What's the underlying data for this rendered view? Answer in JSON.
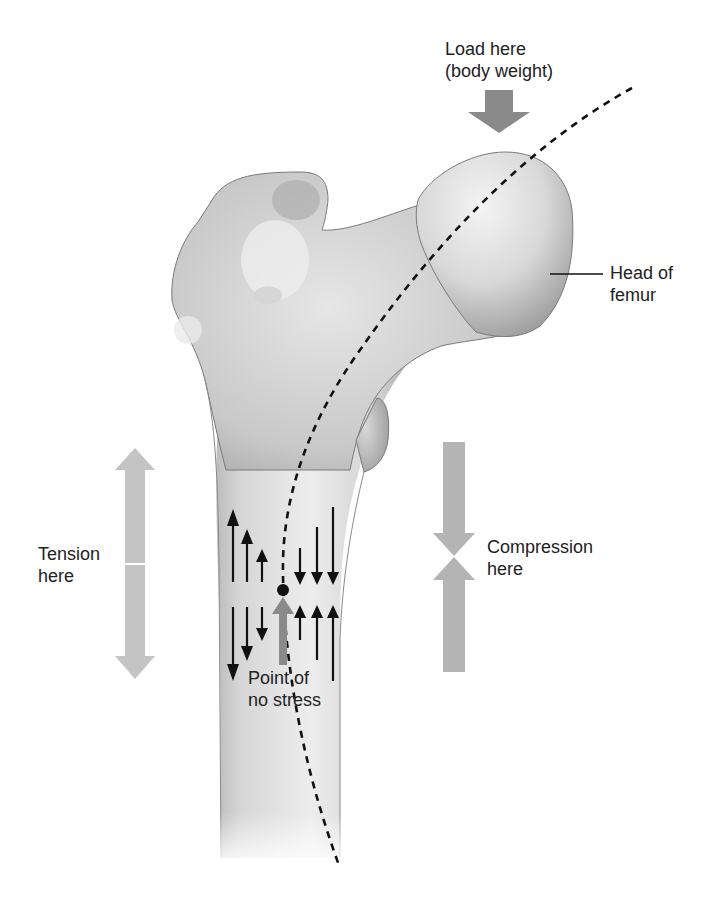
{
  "diagram": {
    "labels": {
      "load": [
        "Load here",
        "(body weight)"
      ],
      "head": [
        "Head of",
        "femur"
      ],
      "tension": [
        "Tension",
        "here"
      ],
      "compression": [
        "Compression",
        "here"
      ],
      "neutral": [
        "Point of",
        "no stress"
      ]
    },
    "colors": {
      "bone_light": "#eeeeee",
      "bone_mid": "#cfcfcf",
      "bone_dark": "#9a9a9a",
      "bone_outline": "#7a7a7a",
      "load_arrow": "#8a8a8a",
      "tension_arrow": "#c4c4c4",
      "compression_arrow": "#b4b4b4",
      "stress_arrows": "#111111",
      "neutral_arrow": "#8a8a8a",
      "text": "#222222"
    },
    "stress_arrows": {
      "tension_side": [
        "up",
        "up",
        "up",
        "down",
        "down",
        "down"
      ],
      "compression_side": [
        "down",
        "down",
        "down",
        "up",
        "up",
        "up"
      ]
    }
  }
}
